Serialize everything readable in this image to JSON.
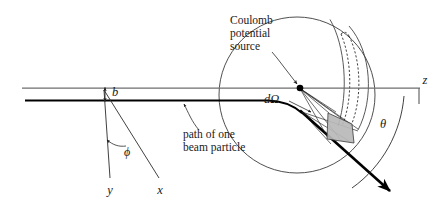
{
  "figure": {
    "type": "physics-schematic",
    "width": 436,
    "height": 205,
    "background_color": "#ffffff"
  },
  "labels": {
    "axis_z": "z",
    "axis_x": "x",
    "axis_y": "y",
    "impact_parameter": "b",
    "azimuthal_angle": "ϕ",
    "scattering_angle": "θ",
    "solid_angle": "dΩ",
    "source_line1": "Coulomb",
    "source_line2": "potential",
    "source_line3": "source",
    "path_line1": "path of one",
    "path_line2": "beam  particle"
  },
  "colors": {
    "axis": "#6e6e6e",
    "sphere_outline": "#3b3b3b",
    "beam": "#000000",
    "patch_fill": "#b9b9b9",
    "dashed": "#2b2b2b",
    "text": "#1a1a1a"
  },
  "geometry": {
    "z_axis": {
      "x1": 22,
      "y1": 88,
      "x2": 420,
      "y2": 88
    },
    "beam_line": {
      "x1": 25,
      "y1": 100.5,
      "x2": 272,
      "y2": 100.5
    },
    "scatter_center": {
      "x": 300,
      "y": 88
    },
    "sphere": {
      "cx": 297,
      "cy": 95,
      "r": 78
    },
    "theta_arc_radius": 108,
    "solid_angle_patch": {
      "cx": 340,
      "cy": 124,
      "w": 26,
      "h": 30
    },
    "scattered_beam": {
      "x1": 272,
      "y1": 100.5,
      "x2": 393,
      "y2": 193
    },
    "y_axis": {
      "x1": 104,
      "y1": 90,
      "x2": 110,
      "y2": 180
    },
    "x_axis": {
      "x1": 104,
      "y1": 90,
      "x2": 162,
      "y2": 180
    },
    "impact_arrow": {
      "x": 105,
      "y_top": 88,
      "y_bottom": 101
    }
  },
  "annotations": {
    "source_leader": {
      "from_x": 279,
      "from_y": 62,
      "to_x": 299,
      "to_y": 86
    },
    "domega_leader": {
      "from_x": 287,
      "from_y": 107,
      "to_x": 312,
      "to_y": 113
    },
    "path_leader": {
      "from_x": 207,
      "from_y": 130,
      "to_x": 183,
      "to_y": 104
    },
    "ray_count": 5
  }
}
